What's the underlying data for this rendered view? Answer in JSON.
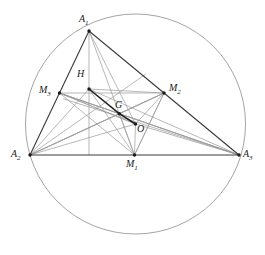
{
  "figure": {
    "type": "euler-line-geometry-diagram",
    "background": "#ffffff",
    "stroke_light": "#8a8a8a",
    "stroke_medium": "#5a5a5a",
    "stroke_dark": "#2e2e2e",
    "width": 265,
    "height": 255
  },
  "labels": {
    "A1": "A",
    "A1_sub": "1",
    "A2": "A",
    "A2_sub": "2",
    "A3": "A",
    "A3_sub": "3",
    "M1": "M",
    "M1_sub": "1",
    "M2": "M",
    "M2_sub": "2",
    "M3": "M",
    "M3_sub": "3",
    "H": "H",
    "G": "G",
    "O": "O"
  },
  "geometry": {
    "circumcircle": {
      "cx": 135.5,
      "cy": 124.0,
      "r": 110.0
    },
    "points": {
      "A1": {
        "x": 89,
        "y": 31,
        "label_x": 79,
        "label_y": 16
      },
      "A2": {
        "x": 30,
        "y": 155,
        "label_x": 12,
        "label_y": 150
      },
      "A3": {
        "x": 239,
        "y": 155,
        "label_x": 243,
        "label_y": 150
      },
      "M1": {
        "x": 134.5,
        "y": 155,
        "label_x": 127,
        "label_y": 160
      },
      "M2": {
        "x": 164,
        "y": 93,
        "label_x": 170,
        "label_y": 85
      },
      "M3": {
        "x": 59.5,
        "y": 93,
        "label_x": 40,
        "label_y": 85
      },
      "H": {
        "x": 89,
        "y": 89,
        "label_x": 77,
        "label_y": 70
      },
      "G": {
        "x": 119.3,
        "y": 113.7,
        "label_x": 114,
        "label_y": 101
      },
      "O": {
        "x": 135.5,
        "y": 124,
        "label_x": 137,
        "label_y": 125
      }
    }
  },
  "segments": {
    "triangle_sides": [
      "A1-A2",
      "A1-A3",
      "A2-A3"
    ],
    "medial_triangle": [
      "M1-M2",
      "M2-M3",
      "M3-M1"
    ],
    "medians": [
      "A1-M1",
      "A2-M2",
      "A3-M3"
    ],
    "altitudes": [
      "A1-M1-foot",
      "A2-foot",
      "A3-foot"
    ],
    "euler_line": [
      "H-G-O"
    ],
    "center_connectors": [
      "O-M1",
      "O-M2",
      "O-M3",
      "H-A1",
      "H-A2",
      "H-A3",
      "G-M1",
      "G-M2",
      "G-M3"
    ]
  }
}
